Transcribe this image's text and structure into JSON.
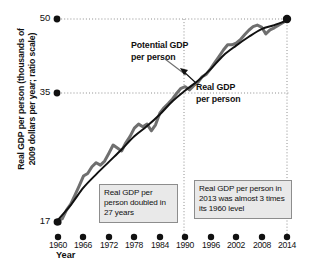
{
  "chart_data": {
    "type": "line",
    "title": "",
    "xlabel": "Year",
    "ylabel": "Real GDP per person (thousands of 2009 dollars per year; ratio scale)",
    "scale": "ratio (logarithmic) y-axis",
    "grid": "horizontal dotted gridlines at labeled y ticks; vertical dotted lines at 1987 and 2014",
    "legend_position": "inline annotations on curves",
    "ylim": [
      16,
      53
    ],
    "yticks": [
      17,
      35,
      50
    ],
    "ytick_labels": [
      "17",
      "35",
      "50"
    ],
    "xlim": [
      1960,
      2014
    ],
    "xticks": [
      1960,
      1966,
      1972,
      1978,
      1984,
      1990,
      1996,
      2002,
      2008,
      2014
    ],
    "xtick_labels": [
      "1960",
      "1966",
      "1972",
      "1978",
      "1984",
      "1990",
      "1996",
      "2002",
      "2008",
      "2014"
    ],
    "series": [
      {
        "name": "Potential GDP per person",
        "style": "smooth thin black line",
        "color": "#111111",
        "x": [
          1960,
          1963,
          1966,
          1969,
          1972,
          1975,
          1978,
          1981,
          1984,
          1987,
          1990,
          1993,
          1996,
          1999,
          2002,
          2005,
          2008,
          2011,
          2014
        ],
        "values": [
          17.2,
          18.6,
          20.4,
          21.9,
          23.4,
          25.0,
          26.8,
          28.3,
          30.1,
          32.3,
          34.2,
          36.0,
          38.3,
          41.2,
          43.4,
          45.5,
          47.4,
          48.4,
          49.6
        ]
      },
      {
        "name": "Real GDP per person",
        "style": "jagged thick gray line",
        "color": "#6f6f6f",
        "x": [
          1960,
          1961,
          1962,
          1963,
          1964,
          1965,
          1966,
          1967,
          1968,
          1969,
          1970,
          1971,
          1972,
          1973,
          1974,
          1975,
          1976,
          1977,
          1978,
          1979,
          1980,
          1981,
          1982,
          1983,
          1984,
          1985,
          1986,
          1987,
          1988,
          1989,
          1990,
          1991,
          1992,
          1993,
          1994,
          1995,
          1996,
          1997,
          1998,
          1999,
          2000,
          2001,
          2002,
          2003,
          2004,
          2005,
          2006,
          2007,
          2008,
          2009,
          2010,
          2011,
          2012,
          2013,
          2014
        ],
        "values": [
          17.2,
          17.3,
          18.1,
          18.7,
          19.6,
          20.6,
          21.7,
          22.0,
          22.8,
          23.3,
          23.0,
          23.5,
          24.5,
          25.6,
          25.2,
          24.8,
          25.9,
          26.8,
          28.0,
          28.6,
          28.2,
          28.6,
          27.6,
          28.5,
          30.3,
          31.2,
          31.9,
          32.7,
          33.7,
          34.6,
          34.9,
          34.3,
          35.1,
          35.7,
          36.8,
          37.3,
          38.4,
          39.7,
          41.0,
          42.4,
          43.6,
          43.6,
          44.0,
          44.8,
          46.0,
          47.1,
          48.0,
          48.4,
          47.9,
          46.2,
          47.2,
          47.7,
          48.4,
          49.0,
          49.8
        ]
      }
    ],
    "annotations": [
      {
        "name": "potential-gdp-label",
        "text_line1": "Potential GDP",
        "text_line2": "per person",
        "points_to": "smooth black curve near 1989"
      },
      {
        "name": "real-gdp-label",
        "text_line1": "Real GDP",
        "text_line2": "per person",
        "points_to": "jagged gray curve near 1992"
      },
      {
        "name": "doubled-callout",
        "text": "Real GDP per person doubled in 27 years",
        "span": "1960 to 1987"
      },
      {
        "name": "triple-callout",
        "text": "Real GDP per person in 2013 was almost 3 times its 1960 level",
        "span": "1987 to 2014"
      }
    ],
    "colors": {
      "potential_line": "#111111",
      "real_line": "#6f6f6f",
      "gridline": "#9a9a9a",
      "callout_fill": "#e9e9e9",
      "callout_border": "#8d8d8d",
      "text": "#111111"
    }
  },
  "axis": {
    "y_label": "Real GDP per person (thousands of\n2009 dollars per year; ratio scale)",
    "y_label_line1": "Real GDP per person (thousands of",
    "y_label_line2": "2009 dollars per year; ratio scale)",
    "x_title": "Year",
    "yticks": [
      "50",
      "35",
      "17"
    ],
    "xticks": [
      "1960",
      "1966",
      "1972",
      "1978",
      "1984",
      "1990",
      "1996",
      "2002",
      "2008",
      "2014"
    ]
  },
  "annotations": {
    "potential_line1": "Potential GDP",
    "potential_line2": "per person",
    "real_line1": "Real GDP",
    "real_line2": "per person",
    "box_doubled": "Real GDP per person doubled in 27 years",
    "box_triple": "Real GDP per person in 2013 was almost 3 times its 1960 level"
  }
}
